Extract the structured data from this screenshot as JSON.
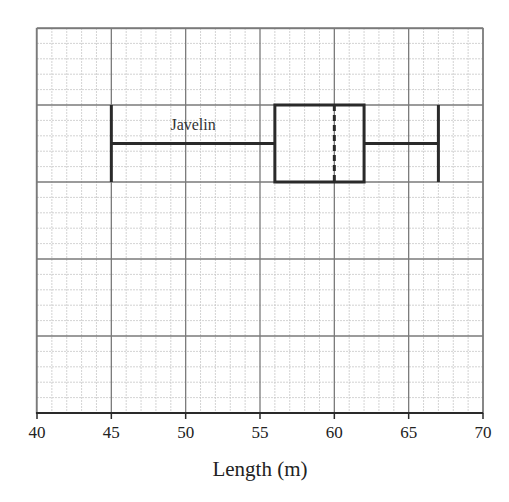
{
  "chart_data": {
    "type": "boxplot",
    "title": "",
    "xlabel": "Length (m)",
    "ylabel": "",
    "xlim": [
      40,
      70
    ],
    "x_ticks": [
      40,
      45,
      50,
      55,
      60,
      65,
      70
    ],
    "x_tick_labels": [
      "40",
      "45",
      "50",
      "55",
      "60",
      "65",
      "70"
    ],
    "grid": true,
    "grid_minor_step_x": 1,
    "series": [
      {
        "name": "Javelin",
        "min": 45,
        "q1": 56,
        "median": 60,
        "q3": 62,
        "max": 67
      }
    ]
  },
  "colors": {
    "background": "#ffffff",
    "grid_minor": "#c8c8c8",
    "grid_major": "#7a7a7a",
    "plot_stroke": "#2a2a2a",
    "text": "#222222"
  }
}
